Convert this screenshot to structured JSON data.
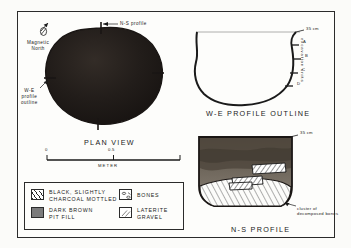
{
  "figure": {
    "panels": {
      "plan": {
        "caption": "PLAN VIEW",
        "north_label": "Magnetic\nNorth",
        "ns_profile_label": "N-S profile",
        "we_profile_label": "W-E\nprofile\noutline"
      },
      "we_profile": {
        "caption": "W-E PROFILE OUTLINE"
      },
      "ns_profile": {
        "caption": "N-S PROFILE",
        "annotation": "cluster of\ndecomposed bones"
      }
    },
    "scale_bar": {
      "start_label": "0",
      "mid_label": "0.5",
      "unit_label": "METER"
    },
    "depth": {
      "we_top_label": "35 cm",
      "ns_top_label": "35 cm",
      "axis_label": "excavation units",
      "unit_marks": [
        "A",
        "B",
        "C",
        "D"
      ]
    },
    "legend": {
      "items": [
        {
          "label": "BLACK, SLIGHTLY\nCHARCOAL MOTTLED",
          "swatch": "hatch-swatch"
        },
        {
          "label": "DARK BROWN\nPIT FILL",
          "swatch": "solid-gray-swatch"
        },
        {
          "label": "BONES",
          "swatch": "bones-swatch"
        },
        {
          "label": "LATERITE\nGRAVEL",
          "swatch": "stipple-swatch"
        }
      ]
    },
    "colors": {
      "ink": "#2b2b2b",
      "pit_fill_dark": "#241f1c",
      "pit_fill_brown": "#6b6259",
      "paper": "#fdfdfb"
    }
  }
}
